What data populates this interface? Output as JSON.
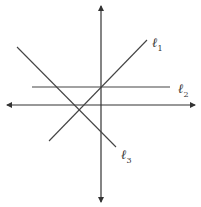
{
  "diagram": {
    "type": "coordinate-plane-with-lines",
    "colors": {
      "axis": "#333333",
      "line": "#444444",
      "background": "#ffffff"
    },
    "axes": {
      "x_axis": {
        "x1": 7,
        "y1": 105,
        "x2": 195,
        "y2": 105,
        "arrows": "both"
      },
      "y_axis": {
        "x1": 101,
        "y1": 6,
        "x2": 101,
        "y2": 202,
        "arrows": "both"
      }
    },
    "lines": [
      {
        "id": "l1",
        "label_main": "ℓ",
        "label_sub": "1",
        "x1": 49,
        "y1": 141,
        "x2": 147,
        "y2": 40,
        "label_x": 152,
        "label_y": 36
      },
      {
        "id": "l2",
        "label_main": "ℓ",
        "label_sub": "2",
        "x1": 32,
        "y1": 87,
        "x2": 170,
        "y2": 87,
        "label_x": 178,
        "label_y": 82
      },
      {
        "id": "l3",
        "label_main": "ℓ",
        "label_sub": "3",
        "x1": 17,
        "y1": 47,
        "x2": 116,
        "y2": 147,
        "label_x": 121,
        "label_y": 148
      }
    ]
  }
}
